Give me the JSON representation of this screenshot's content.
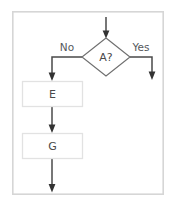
{
  "diagram": {
    "type": "flowchart",
    "background_color": "#ffffff",
    "frame": {
      "name": "diagram-border",
      "stroke_color": "#d6d6d6",
      "x": 12,
      "y": 11,
      "width": 152,
      "height": 184
    },
    "nodes": [
      {
        "id": "decision_a",
        "kind": "decision",
        "label": "A?",
        "cx": 106,
        "cy": 57,
        "rx": 24,
        "ry": 19,
        "stroke_color": "#6f6f6f",
        "fill_color": "#ffffff"
      },
      {
        "id": "process_e",
        "kind": "process",
        "label": "E",
        "x": 22,
        "y": 81,
        "width": 61,
        "height": 26,
        "stroke_color": "#e2e2e2",
        "fill_color": "#ffffff"
      },
      {
        "id": "process_g",
        "kind": "process",
        "label": "G",
        "x": 22,
        "y": 133,
        "width": 61,
        "height": 26,
        "stroke_color": "#e2e2e2",
        "fill_color": "#ffffff"
      }
    ],
    "edges": [
      {
        "id": "edge_entry",
        "from": "entry",
        "to": "decision_a",
        "label": "",
        "stroke_color": "#4a4a4a",
        "arrowhead": true
      },
      {
        "id": "edge_no",
        "from": "decision_a",
        "to": "process_e",
        "label": "No",
        "label_x": 67,
        "label_y": 48,
        "stroke_color": "#4a4a4a",
        "arrowhead": true
      },
      {
        "id": "edge_yes",
        "from": "decision_a",
        "to": "exit_right",
        "label": "Yes",
        "label_x": 141,
        "label_y": 48,
        "stroke_color": "#4a4a4a",
        "arrowhead": true
      },
      {
        "id": "edge_e_to_g",
        "from": "process_e",
        "to": "process_g",
        "label": "",
        "stroke_color": "#4a4a4a",
        "arrowhead": true
      },
      {
        "id": "edge_exit_bottom",
        "from": "process_g",
        "to": "exit_bottom",
        "label": "",
        "stroke_color": "#4a4a4a",
        "arrowhead": true
      }
    ]
  }
}
